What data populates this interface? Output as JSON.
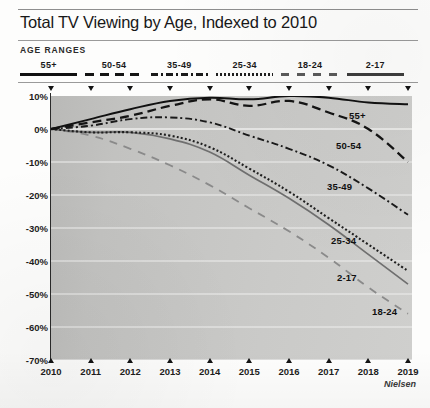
{
  "header": {
    "title": "Total TV Viewing by Age, Indexed to 2010",
    "legend_heading": "AGE RANGES"
  },
  "source": {
    "credit": "Nielsen"
  },
  "colors": {
    "plot_background": "#c6c6c4",
    "axis": "#2a2a2a",
    "gridline": "#efefee",
    "line_dark": "#111111",
    "line_mid": "#6a6a6a",
    "line_light": "#8f8f8f",
    "text": "#1b1b1b"
  },
  "chart_data": {
    "type": "line",
    "title": "Total TV Viewing by Age, Indexed to 2010",
    "xlabel": "",
    "ylabel": "",
    "grid": true,
    "legend_position": "top",
    "ylim": [
      -70,
      10
    ],
    "ytick_labels": [
      "10%",
      "0%",
      "-10%",
      "-20%",
      "-30%",
      "-40%",
      "-50%",
      "-60%",
      "-70%"
    ],
    "ytick_values": [
      10,
      0,
      -10,
      -20,
      -30,
      -40,
      -50,
      -60,
      -70
    ],
    "x": [
      "2010",
      "2011",
      "2012",
      "2013",
      "2014",
      "2015",
      "2016",
      "2017",
      "2018",
      "2019"
    ],
    "series": [
      {
        "name": "55+",
        "style": "solid",
        "color": "#111111",
        "label_x": 349,
        "label_y": 110,
        "values": [
          0,
          3,
          6,
          8.5,
          9.5,
          9,
          10,
          9.5,
          8,
          7.5
        ]
      },
      {
        "name": "50-54",
        "style": "dashed",
        "color": "#141414",
        "label_x": 336,
        "label_y": 140,
        "values": [
          0,
          2,
          4,
          7,
          9,
          7,
          8.5,
          5,
          0,
          -10
        ]
      },
      {
        "name": "35-49",
        "style": "dash-dot",
        "color": "#1a1a1a",
        "label_x": 327,
        "label_y": 181,
        "values": [
          0,
          1,
          3,
          3.5,
          2,
          -2,
          -6,
          -11,
          -18,
          -26
        ]
      },
      {
        "name": "25-34",
        "style": "dotted",
        "color": "#1f1f1f",
        "label_x": 331,
        "label_y": 235,
        "values": [
          0,
          -1,
          -1,
          -2,
          -5.5,
          -12,
          -19,
          -27,
          -35,
          -43
        ]
      },
      {
        "name": "18-24",
        "style": "long-dash",
        "color": "#8f8f8f",
        "label_x": 372,
        "label_y": 306,
        "values": [
          0,
          -2,
          -6,
          -11,
          -17,
          -24,
          -31,
          -39,
          -48,
          -56
        ]
      },
      {
        "name": "2-17",
        "style": "solid-gray",
        "color": "#6a6a6a",
        "label_x": 337,
        "label_y": 272,
        "values": [
          0,
          -1,
          -1,
          -3,
          -7,
          -14,
          -21,
          -29,
          -38,
          -47
        ]
      }
    ]
  },
  "legend": {
    "items": [
      {
        "label": "55+",
        "swatch": "solid"
      },
      {
        "label": "50-54",
        "swatch": "dashed"
      },
      {
        "label": "35-49",
        "swatch": "dash-dot"
      },
      {
        "label": "25-34",
        "swatch": "dotted"
      },
      {
        "label": "18-24",
        "swatch": "long-dash"
      },
      {
        "label": "2-17",
        "swatch": "solid-gray"
      }
    ]
  }
}
